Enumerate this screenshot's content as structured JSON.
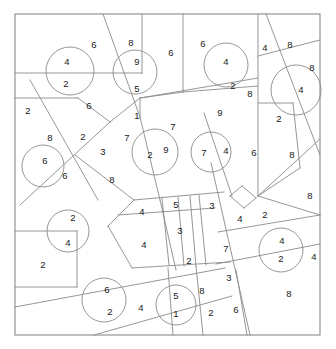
{
  "figure": {
    "kind": "parcel-map",
    "width": 336,
    "height": 349,
    "background_color": "#ffffff",
    "line_color": "#8a8a8a",
    "label_color": "#1a1a1a"
  },
  "frame": {
    "x": 15,
    "y": 14,
    "width": 305,
    "height": 321
  },
  "labels": [
    {
      "id": "lbl-1",
      "text": "6",
      "x": 94,
      "y": 45
    },
    {
      "id": "lbl-2",
      "text": "8",
      "x": 131,
      "y": 43
    },
    {
      "id": "lbl-3",
      "text": "4",
      "x": 67,
      "y": 62
    },
    {
      "id": "lbl-4",
      "text": "9",
      "x": 137,
      "y": 62
    },
    {
      "id": "lbl-5",
      "text": "6",
      "x": 171,
      "y": 53
    },
    {
      "id": "lbl-6",
      "text": "6",
      "x": 203,
      "y": 44
    },
    {
      "id": "lbl-7",
      "text": "4",
      "x": 226,
      "y": 62
    },
    {
      "id": "lbl-8",
      "text": "4",
      "x": 265,
      "y": 48
    },
    {
      "id": "lbl-9",
      "text": "8",
      "x": 290,
      "y": 45
    },
    {
      "id": "lbl-10",
      "text": "8",
      "x": 312,
      "y": 68
    },
    {
      "id": "lbl-11",
      "text": "2",
      "x": 66,
      "y": 84
    },
    {
      "id": "lbl-12",
      "text": "5",
      "x": 137,
      "y": 89
    },
    {
      "id": "lbl-13",
      "text": "2",
      "x": 233,
      "y": 86
    },
    {
      "id": "lbl-14",
      "text": "8",
      "x": 250,
      "y": 94
    },
    {
      "id": "lbl-15",
      "text": "4",
      "x": 301,
      "y": 90
    },
    {
      "id": "lbl-16",
      "text": "6",
      "x": 89,
      "y": 106
    },
    {
      "id": "lbl-17",
      "text": "9",
      "x": 220,
      "y": 113
    },
    {
      "id": "lbl-18",
      "text": "2",
      "x": 28,
      "y": 111
    },
    {
      "id": "lbl-19",
      "text": "1",
      "x": 137,
      "y": 116
    },
    {
      "id": "lbl-20",
      "text": "7",
      "x": 173,
      "y": 127
    },
    {
      "id": "lbl-21",
      "text": "2",
      "x": 279,
      "y": 119
    },
    {
      "id": "lbl-22",
      "text": "8",
      "x": 50,
      "y": 138
    },
    {
      "id": "lbl-23",
      "text": "2",
      "x": 83,
      "y": 137
    },
    {
      "id": "lbl-24",
      "text": "7",
      "x": 127,
      "y": 138
    },
    {
      "id": "lbl-25",
      "text": "2",
      "x": 150,
      "y": 155
    },
    {
      "id": "lbl-26",
      "text": "9",
      "x": 166,
      "y": 150
    },
    {
      "id": "lbl-27",
      "text": "7",
      "x": 204,
      "y": 153
    },
    {
      "id": "lbl-28",
      "text": "4",
      "x": 226,
      "y": 151
    },
    {
      "id": "lbl-29",
      "text": "6",
      "x": 254,
      "y": 153
    },
    {
      "id": "lbl-30",
      "text": "8",
      "x": 292,
      "y": 155
    },
    {
      "id": "lbl-31",
      "text": "3",
      "x": 103,
      "y": 152
    },
    {
      "id": "lbl-32",
      "text": "6",
      "x": 45,
      "y": 161
    },
    {
      "id": "lbl-33",
      "text": "6",
      "x": 65,
      "y": 176
    },
    {
      "id": "lbl-34",
      "text": "8",
      "x": 112,
      "y": 180
    },
    {
      "id": "lbl-35",
      "text": "8",
      "x": 310,
      "y": 196
    },
    {
      "id": "lbl-36",
      "text": "2",
      "x": 73,
      "y": 218
    },
    {
      "id": "lbl-37",
      "text": "4",
      "x": 142,
      "y": 212
    },
    {
      "id": "lbl-38",
      "text": "5",
      "x": 176,
      "y": 205
    },
    {
      "id": "lbl-39",
      "text": "3",
      "x": 212,
      "y": 206
    },
    {
      "id": "lbl-40",
      "text": "2",
      "x": 265,
      "y": 215
    },
    {
      "id": "lbl-41",
      "text": "4",
      "x": 240,
      "y": 219
    },
    {
      "id": "lbl-42",
      "text": "3",
      "x": 180,
      "y": 231
    },
    {
      "id": "lbl-43",
      "text": "4",
      "x": 68,
      "y": 243
    },
    {
      "id": "lbl-44",
      "text": "4",
      "x": 144,
      "y": 245
    },
    {
      "id": "lbl-45",
      "text": "4",
      "x": 282,
      "y": 241
    },
    {
      "id": "lbl-46",
      "text": "7",
      "x": 226,
      "y": 249
    },
    {
      "id": "lbl-47",
      "text": "2",
      "x": 281,
      "y": 259
    },
    {
      "id": "lbl-48",
      "text": "4",
      "x": 314,
      "y": 257
    },
    {
      "id": "lbl-49",
      "text": "2",
      "x": 43,
      "y": 265
    },
    {
      "id": "lbl-50",
      "text": "2",
      "x": 189,
      "y": 261
    },
    {
      "id": "lbl-51",
      "text": "3",
      "x": 229,
      "y": 278
    },
    {
      "id": "lbl-52",
      "text": "6",
      "x": 107,
      "y": 290
    },
    {
      "id": "lbl-53",
      "text": "5",
      "x": 176,
      "y": 296
    },
    {
      "id": "lbl-54",
      "text": "8",
      "x": 202,
      "y": 291
    },
    {
      "id": "lbl-55",
      "text": "8",
      "x": 289,
      "y": 294
    },
    {
      "id": "lbl-56",
      "text": "2",
      "x": 110,
      "y": 312
    },
    {
      "id": "lbl-57",
      "text": "4",
      "x": 141,
      "y": 308
    },
    {
      "id": "lbl-58",
      "text": "1",
      "x": 176,
      "y": 314
    },
    {
      "id": "lbl-59",
      "text": "2",
      "x": 211,
      "y": 313
    },
    {
      "id": "lbl-60",
      "text": "6",
      "x": 236,
      "y": 310
    }
  ],
  "circles": [
    {
      "id": "circ-1",
      "cx": 70,
      "cy": 71,
      "r": 24
    },
    {
      "id": "circ-2",
      "cx": 135,
      "cy": 72,
      "r": 22
    },
    {
      "id": "circ-3",
      "cx": 226,
      "cy": 65,
      "r": 22
    },
    {
      "id": "circ-4",
      "cx": 296,
      "cy": 90,
      "r": 25
    },
    {
      "id": "circ-5",
      "cx": 43,
      "cy": 166,
      "r": 21
    },
    {
      "id": "circ-6",
      "cx": 155,
      "cy": 152,
      "r": 23
    },
    {
      "id": "circ-7",
      "cx": 211,
      "cy": 152,
      "r": 20
    },
    {
      "id": "circ-8",
      "cx": 68,
      "cy": 231,
      "r": 21
    },
    {
      "id": "circ-9",
      "cx": 104,
      "cy": 300,
      "r": 22
    },
    {
      "id": "circ-10",
      "cx": 176,
      "cy": 305,
      "r": 20
    },
    {
      "id": "circ-11",
      "cx": 281,
      "cy": 250,
      "r": 22
    }
  ],
  "lines": [
    {
      "id": "ln-1",
      "x1": 15,
      "y1": 73,
      "x2": 142,
      "y2": 73
    },
    {
      "id": "ln-2",
      "x1": 142,
      "y1": 14,
      "x2": 142,
      "y2": 73
    },
    {
      "id": "ln-3",
      "x1": 103,
      "y1": 14,
      "x2": 140,
      "y2": 117
    },
    {
      "id": "ln-4",
      "x1": 140,
      "y1": 117,
      "x2": 160,
      "y2": 200
    },
    {
      "id": "ln-5",
      "x1": 160,
      "y1": 200,
      "x2": 176,
      "y2": 270
    },
    {
      "id": "ln-6",
      "x1": 183,
      "y1": 14,
      "x2": 183,
      "y2": 92
    },
    {
      "id": "ln-7",
      "x1": 183,
      "y1": 92,
      "x2": 258,
      "y2": 86
    },
    {
      "id": "ln-8",
      "x1": 183,
      "y1": 92,
      "x2": 140,
      "y2": 98
    },
    {
      "id": "ln-9",
      "x1": 140,
      "y1": 98,
      "x2": 140,
      "y2": 117
    },
    {
      "id": "ln-10",
      "x1": 140,
      "y1": 98,
      "x2": 258,
      "y2": 78
    },
    {
      "id": "ln-11",
      "x1": 258,
      "y1": 14,
      "x2": 258,
      "y2": 196
    },
    {
      "id": "ln-12",
      "x1": 258,
      "y1": 56,
      "x2": 320,
      "y2": 40
    },
    {
      "id": "ln-13",
      "x1": 266,
      "y1": 14,
      "x2": 320,
      "y2": 155
    },
    {
      "id": "ln-14",
      "x1": 258,
      "y1": 103,
      "x2": 293,
      "y2": 103
    },
    {
      "id": "ln-15",
      "x1": 293,
      "y1": 103,
      "x2": 300,
      "y2": 168
    },
    {
      "id": "ln-16",
      "x1": 300,
      "y1": 168,
      "x2": 258,
      "y2": 196
    },
    {
      "id": "ln-17",
      "x1": 258,
      "y1": 196,
      "x2": 320,
      "y2": 139
    },
    {
      "id": "ln-18",
      "x1": 15,
      "y1": 98,
      "x2": 78,
      "y2": 98
    },
    {
      "id": "ln-19",
      "x1": 78,
      "y1": 98,
      "x2": 110,
      "y2": 122
    },
    {
      "id": "ln-20",
      "x1": 30,
      "y1": 80,
      "x2": 98,
      "y2": 200
    },
    {
      "id": "ln-21",
      "x1": 110,
      "y1": 122,
      "x2": 20,
      "y2": 205
    },
    {
      "id": "ln-22",
      "x1": 110,
      "y1": 122,
      "x2": 140,
      "y2": 98
    },
    {
      "id": "ln-23",
      "x1": 75,
      "y1": 155,
      "x2": 134,
      "y2": 200
    },
    {
      "id": "ln-24",
      "x1": 134,
      "y1": 200,
      "x2": 108,
      "y2": 226
    },
    {
      "id": "ln-25",
      "x1": 108,
      "y1": 226,
      "x2": 132,
      "y2": 268
    },
    {
      "id": "ln-26",
      "x1": 134,
      "y1": 200,
      "x2": 224,
      "y2": 192
    },
    {
      "id": "ln-27",
      "x1": 132,
      "y1": 268,
      "x2": 230,
      "y2": 262
    },
    {
      "id": "ln-28",
      "x1": 118,
      "y1": 215,
      "x2": 215,
      "y2": 208
    },
    {
      "id": "ln-29",
      "x1": 190,
      "y1": 196,
      "x2": 196,
      "y2": 266
    },
    {
      "id": "ln-30",
      "x1": 199,
      "y1": 195,
      "x2": 206,
      "y2": 265
    },
    {
      "id": "ln-31",
      "x1": 162,
      "y1": 198,
      "x2": 169,
      "y2": 265
    },
    {
      "id": "ln-32",
      "x1": 178,
      "y1": 197,
      "x2": 184,
      "y2": 266
    },
    {
      "id": "ln-33",
      "x1": 211,
      "y1": 163,
      "x2": 250,
      "y2": 335
    },
    {
      "id": "ln-34",
      "x1": 204,
      "y1": 113,
      "x2": 232,
      "y2": 196
    },
    {
      "id": "ln-35",
      "x1": 230,
      "y1": 196,
      "x2": 244,
      "y2": 208
    },
    {
      "id": "ln-36",
      "x1": 244,
      "y1": 208,
      "x2": 256,
      "y2": 198
    },
    {
      "id": "ln-37",
      "x1": 256,
      "y1": 198,
      "x2": 242,
      "y2": 186
    },
    {
      "id": "ln-38",
      "x1": 242,
      "y1": 186,
      "x2": 230,
      "y2": 196
    },
    {
      "id": "ln-39",
      "x1": 216,
      "y1": 264,
      "x2": 320,
      "y2": 244
    },
    {
      "id": "ln-40",
      "x1": 218,
      "y1": 232,
      "x2": 320,
      "y2": 215
    },
    {
      "id": "ln-41",
      "x1": 258,
      "y1": 196,
      "x2": 320,
      "y2": 215
    },
    {
      "id": "ln-42",
      "x1": 236,
      "y1": 270,
      "x2": 247,
      "y2": 335
    },
    {
      "id": "ln-43",
      "x1": 15,
      "y1": 307,
      "x2": 225,
      "y2": 268
    },
    {
      "id": "ln-44",
      "x1": 94,
      "y1": 335,
      "x2": 232,
      "y2": 296
    },
    {
      "id": "ln-45",
      "x1": 15,
      "y1": 231,
      "x2": 77,
      "y2": 231
    },
    {
      "id": "ln-46",
      "x1": 77,
      "y1": 231,
      "x2": 77,
      "y2": 287
    },
    {
      "id": "ln-47",
      "x1": 77,
      "y1": 287,
      "x2": 15,
      "y2": 287
    },
    {
      "id": "ln-48",
      "x1": 168,
      "y1": 268,
      "x2": 173,
      "y2": 335
    },
    {
      "id": "ln-49",
      "x1": 196,
      "y1": 266,
      "x2": 203,
      "y2": 335
    }
  ]
}
